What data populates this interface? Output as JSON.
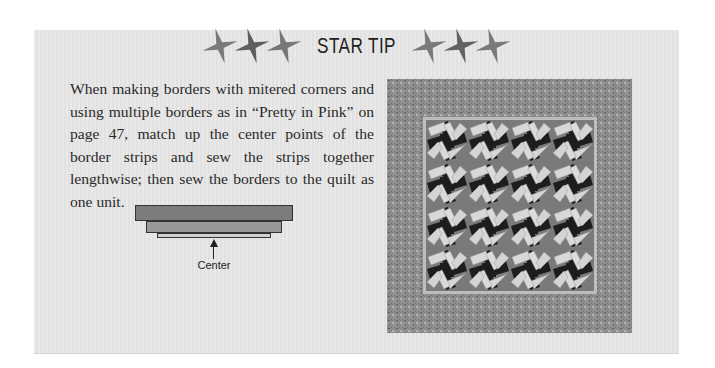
{
  "header": {
    "title": "STAR TIP",
    "left_icons": [
      "star-icon",
      "star-icon",
      "star-icon"
    ],
    "right_icons": [
      "star-icon",
      "star-icon",
      "star-icon"
    ]
  },
  "tip": {
    "text": "When making borders with mitered corners and using multiple borders as in “Pretty in Pink” on page 47, match up the center points of the border strips and sew the strips together lengthwise; then sew the borders to the quilt as one unit."
  },
  "diagram": {
    "label": "Center",
    "strips": 3
  },
  "quilt_image": {
    "description": "Pretty in Pink quilt photo",
    "grid": [
      4,
      4
    ],
    "colors": {
      "border": "#8f8f8f",
      "inner_frame": "#bdbdbd",
      "background": "#777777",
      "light_rect": "#d9d9d9",
      "dark_center": "#1e1e1e"
    }
  },
  "colors": {
    "panel_bg": "#e6e6e6",
    "text": "#2a2a2a",
    "star": "#6e6e6e"
  }
}
